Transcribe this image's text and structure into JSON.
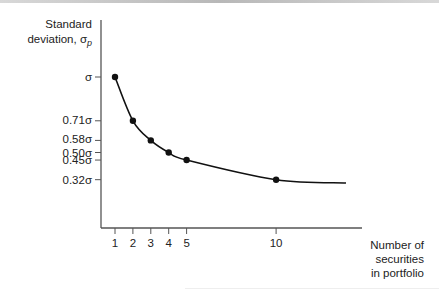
{
  "chart_data": {
    "type": "line",
    "title": "",
    "ylabel": "Standard deviation, σp",
    "ylabel_lines": [
      "Standard",
      "deviation, σ",
      "p"
    ],
    "xlabel": "Number of securities in portfolio",
    "xlabel_lines": [
      "Number of",
      "securities",
      "in portfolio"
    ],
    "x_ticks": [
      1,
      2,
      3,
      4,
      5,
      10
    ],
    "x_tick_labels": [
      "1",
      "2",
      "3",
      "4",
      "5",
      "10"
    ],
    "y_ticks": [
      1.0,
      0.71,
      0.58,
      0.5,
      0.45,
      0.32
    ],
    "y_tick_labels": [
      "σ",
      "0.71σ",
      "0.58σ",
      "0.50σ",
      "0.45σ",
      "0.32σ"
    ],
    "series": [
      {
        "name": "Portfolio standard deviation",
        "x": [
          1,
          2,
          3,
          4,
          5,
          10
        ],
        "values": [
          1.0,
          0.71,
          0.58,
          0.5,
          0.45,
          0.32
        ],
        "markers": true
      }
    ],
    "curve_extends_to_x": 14,
    "curve_end_value": 0.28,
    "grid": false,
    "legend": "none"
  }
}
